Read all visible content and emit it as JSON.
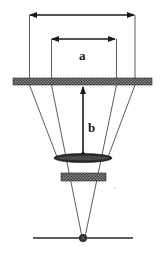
{
  "diagram": {
    "type": "optical-geometry",
    "labels": {
      "a": "a",
      "b": "b"
    },
    "colors": {
      "line": "#2a2a2a",
      "hatch_dark": "#3a3a3a",
      "hatch_light": "#9a9a9a",
      "background": "#ffffff"
    },
    "elements": [
      {
        "id": "outer-dimension-arrow",
        "desc": "double-headed horizontal arrow spanning outer width"
      },
      {
        "id": "inner-dimension-arrow",
        "desc": "double-headed horizontal arrow labeled a"
      },
      {
        "id": "hatched-plate",
        "desc": "wide hatched horizontal bar"
      },
      {
        "id": "distance-arrow-b",
        "desc": "vertical arrow from lens up to plate, labeled b"
      },
      {
        "id": "lens",
        "desc": "dark elliptical lens"
      },
      {
        "id": "small-hatched-block",
        "desc": "small hatched rectangle below lens"
      },
      {
        "id": "focal-point",
        "desc": "dark dot on baseline where rays converge"
      },
      {
        "id": "baseline",
        "desc": "horizontal line through focal point"
      }
    ]
  }
}
